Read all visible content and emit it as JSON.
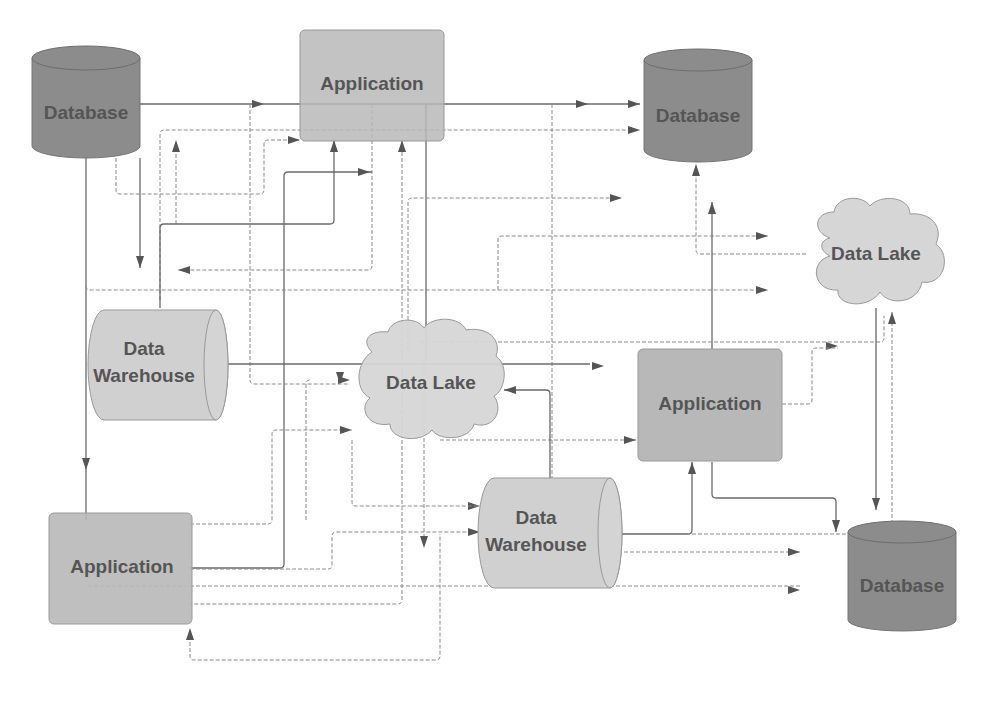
{
  "diagram": {
    "nodes": {
      "db_top_left": {
        "label": "Database",
        "type": "database"
      },
      "app_top": {
        "label": "Application",
        "type": "application"
      },
      "db_top_right": {
        "label": "Database",
        "type": "database"
      },
      "lake_right": {
        "label": "Data Lake",
        "type": "data-lake"
      },
      "dw_left_l1": {
        "label": "Data",
        "type": "data-warehouse"
      },
      "dw_left_l2": {
        "label": "Warehouse",
        "type": "data-warehouse"
      },
      "lake_center": {
        "label": "Data Lake",
        "type": "data-lake"
      },
      "app_right": {
        "label": "Application",
        "type": "application"
      },
      "app_bottom_left": {
        "label": "Application",
        "type": "application"
      },
      "dw_bottom_l1": {
        "label": "Data",
        "type": "data-warehouse"
      },
      "dw_bottom_l2": {
        "label": "Warehouse",
        "type": "data-warehouse"
      },
      "db_bottom_right": {
        "label": "Database",
        "type": "database"
      }
    },
    "colors": {
      "database_fill": "#8c8c8c",
      "application_fill": "#b8b8b8",
      "warehouse_fill": "#d0d0d0",
      "lake_fill": "#d6d6d6",
      "label_text": "#555555",
      "connector": "#777777"
    }
  }
}
